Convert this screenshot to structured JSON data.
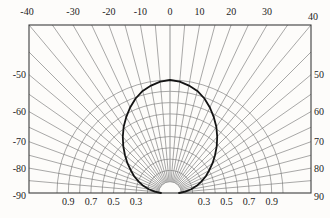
{
  "figure": {
    "background": "#fdfcfa",
    "grid_color": "#6f6f6f",
    "frame_color": "#3d3d3d",
    "zero_line_color": "#9b9b9b",
    "curve_color": "#141414",
    "text_color": "#1d1d1d"
  },
  "chart_data": {
    "type": "line",
    "subtype": "polar-radiation-pattern",
    "title": "",
    "xlabel": "",
    "ylabel": "",
    "angle_unit": "degrees",
    "angle_range": [
      -90,
      90
    ],
    "angle_grid_step_deg": 5,
    "radial_grid_values": [
      0.1,
      0.2,
      0.3,
      0.4,
      0.5,
      0.6,
      0.7,
      0.8,
      0.9,
      1.0
    ],
    "radial_max": 1.0,
    "grid": true,
    "legend": false,
    "top_axis_labels": [
      {
        "angle": -40,
        "label": "-40"
      },
      {
        "angle": -30,
        "label": "-30"
      },
      {
        "angle": -20,
        "label": "-20"
      },
      {
        "angle": -10,
        "label": "-10"
      },
      {
        "angle": 0,
        "label": "0"
      },
      {
        "angle": 10,
        "label": "10"
      },
      {
        "angle": 20,
        "label": "20"
      },
      {
        "angle": 30,
        "label": "30"
      },
      {
        "angle": 40,
        "label": "40"
      }
    ],
    "left_axis_labels": [
      {
        "angle": -50,
        "label": "-50"
      },
      {
        "angle": -60,
        "label": "-60"
      },
      {
        "angle": -70,
        "label": "-70"
      },
      {
        "angle": -80,
        "label": "-80"
      },
      {
        "angle": -90,
        "label": "-90"
      }
    ],
    "right_axis_labels": [
      {
        "angle": 50,
        "label": "50"
      },
      {
        "angle": 60,
        "label": "60"
      },
      {
        "angle": 70,
        "label": "70"
      },
      {
        "angle": 80,
        "label": "80"
      },
      {
        "angle": 90,
        "label": "90"
      }
    ],
    "bottom_axis_labels": [
      {
        "r": 0.9,
        "side": "left",
        "label": "0.9"
      },
      {
        "r": 0.7,
        "side": "left",
        "label": "0.7"
      },
      {
        "r": 0.5,
        "side": "left",
        "label": "0.5"
      },
      {
        "r": 0.3,
        "side": "left",
        "label": "0.3"
      },
      {
        "r": 0.3,
        "side": "right",
        "label": "0.3"
      },
      {
        "r": 0.5,
        "side": "right",
        "label": "0.5"
      },
      {
        "r": 0.7,
        "side": "right",
        "label": "0.7"
      },
      {
        "r": 0.9,
        "side": "right",
        "label": "0.9"
      }
    ],
    "series": [
      {
        "name": "relative-radiant-intensity",
        "angles": [
          -90,
          -85,
          -80,
          -75,
          -70,
          -65,
          -60,
          -55,
          -50,
          -45,
          -40,
          -35,
          -30,
          -25,
          -20,
          -15,
          -10,
          -5,
          0,
          5,
          10,
          15,
          20,
          25,
          30,
          35,
          40,
          45,
          50,
          55,
          60,
          65,
          70,
          75,
          80,
          85,
          90
        ],
        "values": [
          0.08,
          0.135,
          0.19,
          0.245,
          0.295,
          0.35,
          0.4,
          0.46,
          0.52,
          0.585,
          0.65,
          0.715,
          0.775,
          0.835,
          0.89,
          0.935,
          0.965,
          0.99,
          1.0,
          0.99,
          0.965,
          0.935,
          0.89,
          0.835,
          0.775,
          0.715,
          0.65,
          0.585,
          0.52,
          0.46,
          0.4,
          0.35,
          0.295,
          0.245,
          0.19,
          0.135,
          0.08
        ]
      }
    ]
  }
}
